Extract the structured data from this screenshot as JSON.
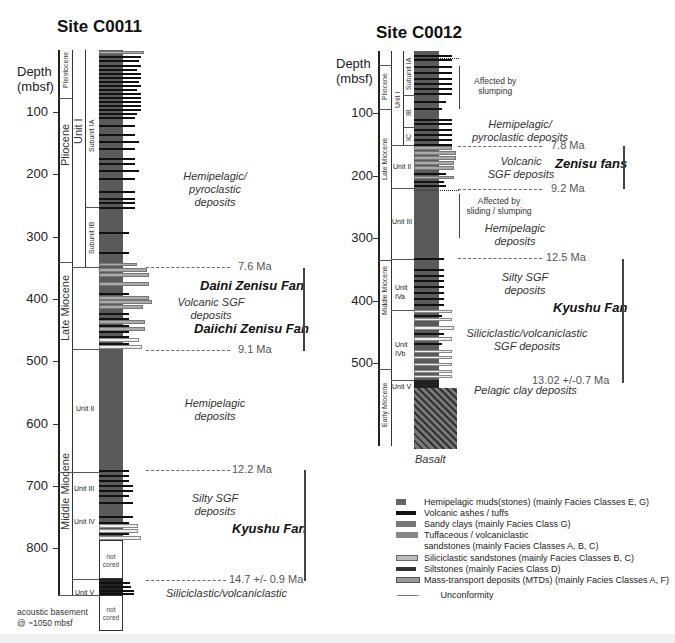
{
  "sites": [
    {
      "title": "Site C0011",
      "depth_label_line1": "Depth",
      "depth_label_line2": "(mbsf)",
      "depth_ticks": [
        "100",
        "200",
        "300",
        "400",
        "500",
        "600",
        "700",
        "800"
      ],
      "epochs": [
        "Pleistocene",
        "Pliocene",
        "Late Miocene",
        "Middle Miocene"
      ],
      "units": [
        "Unit I",
        "Unit II",
        "Unit III",
        "Unit IV",
        "Unit V"
      ],
      "subunits": [
        "Subunit IA",
        "Subunit IB"
      ],
      "not_cored": "not cored",
      "basement_note_line1": "acoustic basement",
      "basement_note_line2": "@ ~1050 mbsf",
      "annotations": {
        "hemipelagic_pyroclastic": [
          "Hemipelagic/",
          "pyroclastic",
          "deposits"
        ],
        "volcanic_sgf": [
          "Volcanic SGF",
          "deposits"
        ],
        "hemipelagic": [
          "Hemipelagic",
          "deposits"
        ],
        "silty_sgf": [
          "Silty SGF",
          "deposits"
        ],
        "siliciclastic": "Siliciclastic/volcaniclastic"
      },
      "fans": [
        "Daini Zenisu Fan",
        "Daiichi Zenisu Fan",
        "Kyushu Fan"
      ],
      "ages": [
        "7.6 Ma",
        "9.1 Ma",
        "12.2 Ma",
        "14.7 +/- 0.9 Ma"
      ]
    },
    {
      "title": "Site C0012",
      "depth_label_line1": "Depth",
      "depth_label_line2": "(mbsf)",
      "depth_ticks": [
        "100",
        "200",
        "300",
        "400",
        "500"
      ],
      "epochs": [
        "Pliocene",
        "Late Miocene",
        "Middle Miocene",
        "Early Miocene"
      ],
      "units": [
        "Unit I",
        "Unit II",
        "Unit III",
        "Unit IVa",
        "Unit IVb",
        "Unit V"
      ],
      "unit_labels_split": {
        "iva": [
          "Unit",
          "IVa"
        ],
        "ivb": [
          "Unit",
          "IVb"
        ]
      },
      "subunits": [
        "Subunit IA",
        "IB",
        "IC"
      ],
      "annotations": {
        "slumping": [
          "Affected by",
          "slumping"
        ],
        "hemipelagic_pyroclastic": [
          "Hemipelagic/",
          "pyroclastic deposits"
        ],
        "volcanic_sgf": [
          "Volcanic",
          "SGF deposits"
        ],
        "sliding": [
          "Affected by",
          "sliding / slumping"
        ],
        "hemipelagic": [
          "Hemipelagic",
          "deposits"
        ],
        "silty_sgf": [
          "Silty SGF",
          "deposits"
        ],
        "siliciclastic_sgf": [
          "Siliciclastic/volcaniclastic",
          "SGF deposits"
        ],
        "pelagic_clay": "Pelagic clay deposits",
        "basalt": "Basalt"
      },
      "fans": [
        "Zenisu fans",
        "Kyushu Fan"
      ],
      "ages": [
        "7.8 Ma",
        "9.2 Ma",
        "12.5 Ma",
        "13.02 +/-0.7 Ma"
      ]
    }
  ],
  "legend": {
    "items": [
      {
        "label": "Hemipelagic muds(stones) (mainly Facies Classes E, G)",
        "color": "#666666"
      },
      {
        "label": "Volcanic ashes / tuffs",
        "color": "#111111"
      },
      {
        "label": "Sandy clays (mainly Facies Class G)",
        "color": "#777777"
      },
      {
        "label": "Tuffaceous / volcaniclastic",
        "label2": "sandstones (mainly Facies Classes A, B, C)",
        "color": "#888888"
      },
      {
        "label": "Siliciclastic sandstones (mainly Facies Classes B, C)",
        "color": "#bbbbbb"
      },
      {
        "label": "Siltstones (mainly Facies Class D)",
        "color": "#333333"
      },
      {
        "label": "Mass-transport deposits (MTDs) (mainly Facies Classes A, F)",
        "color": "#999999"
      }
    ],
    "unconformity": "Unconformity"
  }
}
